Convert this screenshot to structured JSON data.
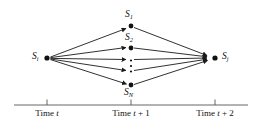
{
  "figure": {
    "type": "state-transition-trellis",
    "background_color": "#ffffff",
    "stroke_color": "#1a1a1a",
    "text_color": "#111111"
  },
  "nodes": {
    "source": {
      "id": "S_i",
      "label_base": "S",
      "label_sub": "i",
      "x": 47,
      "y": 58
    },
    "target": {
      "id": "S_j",
      "label_base": "S",
      "label_sub": "j",
      "x": 215,
      "y": 58
    },
    "middle": [
      {
        "id": "S_1",
        "label_base": "S",
        "label_sub": "1",
        "x": 131,
        "y": 26
      },
      {
        "id": "S_2",
        "label_base": "S",
        "label_sub": "2",
        "x": 131,
        "y": 48
      },
      {
        "id": "S_N",
        "label_base": "S",
        "label_sub": "N",
        "x": 131,
        "y": 85
      }
    ],
    "ellipsis": {
      "symbol": "vertical-dots",
      "x": 131,
      "y": 65,
      "dot_count": 3
    }
  },
  "edges": {
    "fan_out_count": 5,
    "fan_in_count": 5,
    "arrowheads": "both-stages"
  },
  "axis": {
    "line": {
      "x1": 14,
      "x2": 248,
      "y": 105
    },
    "ticks": [
      {
        "x": 47,
        "label_prefix": "Time ",
        "label_var": "t",
        "label_suffix": ""
      },
      {
        "x": 131,
        "label_prefix": "Time ",
        "label_var": "t",
        "label_suffix": " + 1"
      },
      {
        "x": 215,
        "label_prefix": "Time ",
        "label_var": "t",
        "label_suffix": " + 2"
      }
    ]
  }
}
